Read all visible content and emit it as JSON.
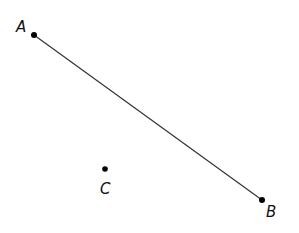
{
  "diagram": {
    "points": [
      {
        "label": "A",
        "x": 34,
        "y": 35
      },
      {
        "label": "B",
        "x": 262,
        "y": 200
      },
      {
        "label": "C",
        "x": 105,
        "y": 169
      }
    ],
    "segments": [
      {
        "from": "A",
        "to": "B"
      }
    ],
    "colors": {
      "line": "#333333",
      "point": "#000000",
      "background": "#ffffff"
    }
  }
}
